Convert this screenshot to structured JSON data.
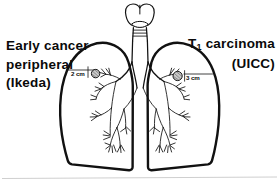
{
  "figure": {
    "background_color": "#ffffff",
    "ink_color": "#0a0a0a"
  },
  "labels": {
    "left": {
      "name": "early-cancer-label",
      "lines": [
        "Early cancer",
        "peripheral",
        "(Ikeda)"
      ]
    },
    "right": {
      "name": "t1-carcinoma-label",
      "line1_prefix": "T",
      "line1_subscript": "1",
      "line1_suffix": " carcinoma",
      "line2": "(UICC)"
    }
  },
  "measurements": {
    "left": {
      "name": "left-tumor-size",
      "text": "2 cm"
    },
    "right": {
      "name": "right-tumor-size",
      "text": "3 cm"
    }
  },
  "anatomy": {
    "larynx": "larynx-thyroid-cartilage",
    "trachea": "trachea",
    "carina": "carina",
    "left_lung": "left-lung-outline",
    "right_lung": "right-lung-outline",
    "left_bronchial_tree": "left-bronchial-tree",
    "right_bronchial_tree": "right-bronchial-tree",
    "left_nodule": "left-tumor-nodule",
    "right_nodule": "right-tumor-nodule",
    "baseline": "baseline-rule"
  }
}
